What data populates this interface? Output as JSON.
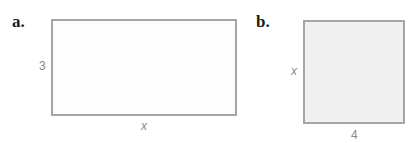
{
  "figures": [
    {
      "label": "a.",
      "height_label": "3",
      "width_label": "x",
      "fill": "#fdfdfd"
    },
    {
      "label": "b.",
      "height_label": "x",
      "width_label": "4",
      "fill": "#f0f0f0"
    }
  ]
}
